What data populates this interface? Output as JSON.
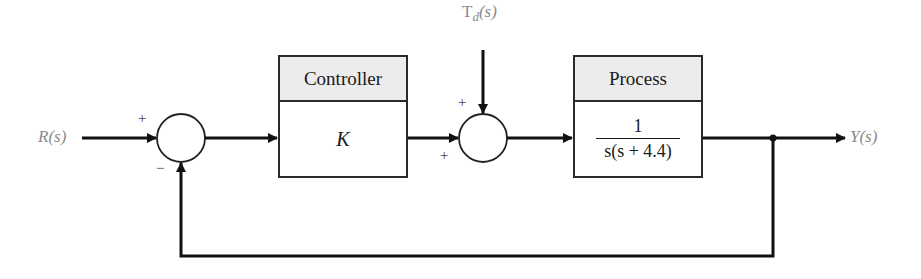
{
  "diagram": {
    "type": "feedback-control-block-diagram",
    "input_label": "R(s)",
    "output_label": "Y(s)",
    "disturbance_label": "T_d(s)",
    "disturbance": {
      "main": "T",
      "sub": "d",
      "arg": "(s)"
    },
    "summing_junctions": [
      {
        "id": "sum1",
        "signs": {
          "top_left": "+",
          "bottom": "−"
        }
      },
      {
        "id": "sum2",
        "signs": {
          "top": "+",
          "bottom_left": "+"
        }
      }
    ],
    "blocks": [
      {
        "id": "controller",
        "header": "Controller",
        "transfer_function": "K"
      },
      {
        "id": "process",
        "header": "Process",
        "numerator": "1",
        "denominator": "s(s + 4.4)"
      }
    ],
    "feedback": "unity negative feedback from Y(s) to first summing junction"
  }
}
